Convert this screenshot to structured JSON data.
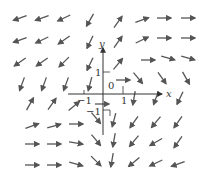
{
  "diagram": {
    "type": "vector_field",
    "axis_labels": {
      "x": "x",
      "y": "y"
    },
    "tick_labels": {
      "x_pos": "1",
      "x_neg": "−1",
      "y_pos": "1",
      "y_neg": "−1",
      "origin": "0"
    },
    "colors": {
      "arrow": "#555555",
      "axis": "#333333"
    },
    "arrows": [
      {
        "x": 20,
        "y": 18,
        "a": 200
      },
      {
        "x": 42,
        "y": 18,
        "a": 200
      },
      {
        "x": 64,
        "y": 18,
        "a": 205
      },
      {
        "x": 90,
        "y": 20,
        "a": 240
      },
      {
        "x": 118,
        "y": 22,
        "a": 55
      },
      {
        "x": 142,
        "y": 20,
        "a": 20
      },
      {
        "x": 164,
        "y": 18,
        "a": 0
      },
      {
        "x": 188,
        "y": 18,
        "a": 0
      },
      {
        "x": 20,
        "y": 40,
        "a": 200
      },
      {
        "x": 42,
        "y": 40,
        "a": 205
      },
      {
        "x": 64,
        "y": 40,
        "a": 215
      },
      {
        "x": 90,
        "y": 42,
        "a": 245
      },
      {
        "x": 118,
        "y": 42,
        "a": 55
      },
      {
        "x": 142,
        "y": 40,
        "a": 25
      },
      {
        "x": 164,
        "y": 38,
        "a": 0
      },
      {
        "x": 188,
        "y": 38,
        "a": 0
      },
      {
        "x": 20,
        "y": 62,
        "a": 215
      },
      {
        "x": 42,
        "y": 62,
        "a": 215
      },
      {
        "x": 64,
        "y": 62,
        "a": 225
      },
      {
        "x": 90,
        "y": 64,
        "a": 245
      },
      {
        "x": 118,
        "y": 64,
        "a": 50
      },
      {
        "x": 148,
        "y": 60,
        "a": 0
      },
      {
        "x": 168,
        "y": 58,
        "a": -15
      },
      {
        "x": 188,
        "y": 58,
        "a": -15
      },
      {
        "x": 22,
        "y": 84,
        "a": 250
      },
      {
        "x": 44,
        "y": 84,
        "a": 250
      },
      {
        "x": 66,
        "y": 84,
        "a": 250
      },
      {
        "x": 90,
        "y": 84,
        "a": 255
      },
      {
        "x": 138,
        "y": 78,
        "a": -50
      },
      {
        "x": 162,
        "y": 78,
        "a": -55
      },
      {
        "x": 186,
        "y": 78,
        "a": -60
      },
      {
        "x": 30,
        "y": 104,
        "a": 60
      },
      {
        "x": 52,
        "y": 104,
        "a": 55
      },
      {
        "x": 74,
        "y": 106,
        "a": 40
      },
      {
        "x": 134,
        "y": 98,
        "a": -100
      },
      {
        "x": 156,
        "y": 98,
        "a": -110
      },
      {
        "x": 180,
        "y": 98,
        "a": -115
      },
      {
        "x": 32,
        "y": 126,
        "a": 20
      },
      {
        "x": 54,
        "y": 126,
        "a": 15
      },
      {
        "x": 76,
        "y": 124,
        "a": 0
      },
      {
        "x": 96,
        "y": 118,
        "a": -50
      },
      {
        "x": 114,
        "y": 120,
        "a": -105
      },
      {
        "x": 134,
        "y": 122,
        "a": -125
      },
      {
        "x": 156,
        "y": 122,
        "a": -130
      },
      {
        "x": 178,
        "y": 122,
        "a": -125
      },
      {
        "x": 32,
        "y": 144,
        "a": 0
      },
      {
        "x": 54,
        "y": 144,
        "a": 0
      },
      {
        "x": 76,
        "y": 143,
        "a": -10
      },
      {
        "x": 96,
        "y": 140,
        "a": -50
      },
      {
        "x": 114,
        "y": 140,
        "a": -100
      },
      {
        "x": 134,
        "y": 141,
        "a": -130
      },
      {
        "x": 156,
        "y": 142,
        "a": -150
      },
      {
        "x": 178,
        "y": 142,
        "a": -125
      },
      {
        "x": 32,
        "y": 165,
        "a": 0
      },
      {
        "x": 54,
        "y": 165,
        "a": 0
      },
      {
        "x": 76,
        "y": 164,
        "a": -15
      },
      {
        "x": 96,
        "y": 161,
        "a": -45
      },
      {
        "x": 112,
        "y": 160,
        "a": -100
      },
      {
        "x": 134,
        "y": 162,
        "a": -140
      },
      {
        "x": 156,
        "y": 163,
        "a": -155
      },
      {
        "x": 178,
        "y": 164,
        "a": -160
      },
      {
        "x": 102,
        "y": 104,
        "a": 0
      },
      {
        "x": 123,
        "y": 80,
        "a": 0
      }
    ]
  }
}
